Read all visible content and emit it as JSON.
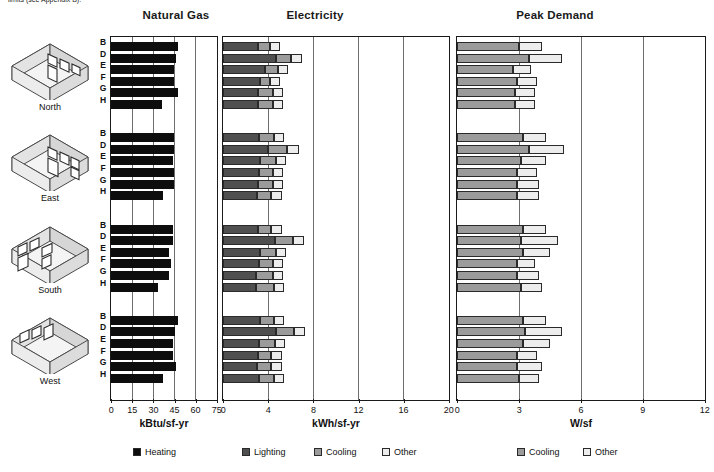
{
  "top_note": "limits (see Appendix B).",
  "panels": {
    "gas": {
      "title": "Natural Gas",
      "axis_label": "kBtu/sf-yr",
      "ticks": [
        0,
        15,
        30,
        45,
        60,
        75
      ],
      "max": 75
    },
    "elec": {
      "title": "Electricity",
      "axis_label": "kWh/sf-yr",
      "ticks": [
        0,
        4,
        8,
        12,
        16,
        20
      ],
      "max": 20
    },
    "peak": {
      "title": "Peak Demand",
      "axis_label": "W/sf",
      "ticks": [
        0,
        3,
        6,
        9,
        12
      ],
      "max": 12
    }
  },
  "row_labels": [
    "B",
    "D",
    "E",
    "F",
    "G",
    "H"
  ],
  "orientations": [
    "North",
    "East",
    "South",
    "West"
  ],
  "legend_left": [
    {
      "name": "Heating",
      "color": "#0d0d0d"
    }
  ],
  "legend_right": [
    {
      "name": "Lighting",
      "color": "#4f4f4f"
    },
    {
      "name": "Cooling",
      "color": "#9b9b9b"
    },
    {
      "name": "Other",
      "color": "#ededed"
    }
  ],
  "legend_peak": [
    {
      "name": "Cooling",
      "color": "#9b9b9b"
    },
    {
      "name": "Other",
      "color": "#ededed"
    }
  ],
  "chart_data": {
    "type": "bar",
    "groups": [
      "North",
      "East",
      "South",
      "West"
    ],
    "categories": [
      "B",
      "D",
      "E",
      "F",
      "G",
      "H"
    ],
    "subplots": [
      {
        "name": "Natural Gas",
        "xlabel": "kBtu/sf-yr",
        "xlim": [
          0,
          75
        ],
        "xticks": [
          0,
          15,
          30,
          45,
          60,
          75
        ],
        "stacked": true,
        "series": [
          {
            "name": "Heating",
            "color": "#0d0d0d"
          }
        ],
        "values": {
          "North": {
            "Heating": [
              48.0,
              46.0,
              44.5,
              44.5,
              48.0,
              36.0
            ]
          },
          "East": {
            "Heating": [
              45.0,
              44.5,
              44.0,
              44.5,
              45.0,
              37.0
            ]
          },
          "South": {
            "Heating": [
              44.0,
              44.0,
              41.0,
              43.0,
              41.0,
              33.5
            ]
          },
          "West": {
            "Heating": [
              47.5,
              45.5,
              44.0,
              44.0,
              46.5,
              37.0
            ]
          }
        }
      },
      {
        "name": "Electricity",
        "xlabel": "kWh/sf-yr",
        "xlim": [
          0,
          20
        ],
        "xticks": [
          0,
          4,
          8,
          12,
          16,
          20
        ],
        "stacked": true,
        "series": [
          {
            "name": "Lighting",
            "color": "#4f4f4f"
          },
          {
            "name": "Cooling",
            "color": "#9b9b9b"
          },
          {
            "name": "Other",
            "color": "#ededed"
          }
        ],
        "values": {
          "North": {
            "Lighting": [
              3.1,
              4.7,
              3.7,
              3.3,
              3.1,
              3.1
            ],
            "Cooling": [
              1.1,
              1.3,
              1.2,
              0.9,
              1.3,
              1.3
            ],
            "Other": [
              0.9,
              1.0,
              0.9,
              0.9,
              0.9,
              0.9
            ]
          },
          "East": {
            "Lighting": [
              3.2,
              4.0,
              3.3,
              3.2,
              3.1,
              3.0
            ],
            "Cooling": [
              1.3,
              1.7,
              1.4,
              1.2,
              1.3,
              1.3
            ],
            "Other": [
              0.9,
              1.0,
              0.9,
              0.9,
              0.9,
              0.9
            ]
          },
          "South": {
            "Lighting": [
              3.1,
              4.6,
              3.3,
              3.2,
              2.9,
              2.9
            ],
            "Cooling": [
              1.2,
              1.6,
              1.4,
              1.2,
              1.5,
              1.6
            ],
            "Other": [
              0.9,
              1.0,
              0.9,
              0.9,
              0.9,
              0.9
            ]
          },
          "West": {
            "Lighting": [
              3.3,
              4.7,
              3.2,
              3.1,
              3.0,
              3.2
            ],
            "Cooling": [
              1.2,
              1.6,
              1.4,
              1.2,
              1.3,
              1.3
            ],
            "Other": [
              0.9,
              1.0,
              0.9,
              0.9,
              0.9,
              0.9
            ]
          }
        }
      },
      {
        "name": "Peak Demand",
        "xlabel": "W/sf",
        "xlim": [
          0,
          12
        ],
        "xticks": [
          0,
          3,
          6,
          9,
          12
        ],
        "stacked": true,
        "series": [
          {
            "name": "Cooling",
            "color": "#9b9b9b"
          },
          {
            "name": "Other",
            "color": "#ededed"
          }
        ],
        "values": {
          "North": {
            "Cooling": [
              3.0,
              3.5,
              2.7,
              2.9,
              2.8,
              2.8
            ],
            "Other": [
              1.1,
              1.6,
              0.9,
              1.0,
              1.0,
              1.0
            ]
          },
          "East": {
            "Cooling": [
              3.2,
              3.5,
              3.1,
              2.9,
              2.9,
              2.9
            ],
            "Other": [
              1.1,
              1.7,
              1.2,
              1.0,
              1.1,
              1.1
            ]
          },
          "South": {
            "Cooling": [
              3.2,
              3.1,
              3.2,
              2.9,
              2.9,
              3.1
            ],
            "Other": [
              1.1,
              1.8,
              1.3,
              0.9,
              1.1,
              1.0
            ]
          },
          "West": {
            "Cooling": [
              3.2,
              3.3,
              3.2,
              2.9,
              2.9,
              3.0
            ],
            "Other": [
              1.1,
              1.8,
              1.3,
              1.0,
              1.2,
              1.0
            ]
          }
        }
      }
    ]
  }
}
